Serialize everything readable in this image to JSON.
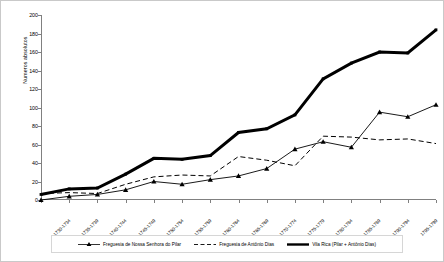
{
  "chart_data": {
    "type": "line",
    "title": "",
    "xlabel": "",
    "ylabel": "Numeros absolutos",
    "ylim": [
      0,
      200
    ],
    "ytick_step": 20,
    "grid": false,
    "legend_position": "bottom",
    "categories": [
      "1730-1734",
      "1735-1739",
      "1740-1744",
      "1745-1749",
      "1750-1754",
      "1755-1759",
      "1760-1764",
      "1765-1769",
      "1770-1774",
      "1775-1779",
      "1780-1784",
      "1785-1789",
      "1790-1794",
      "1795-1799",
      "1800-1804"
    ],
    "yticks": [
      0,
      20,
      40,
      60,
      80,
      100,
      120,
      140,
      160,
      180,
      200
    ],
    "series": [
      {
        "name": "Freguesia de Nossa Senhora do Pilar",
        "style": "solid-thin-triangle-marker",
        "color": "#000000",
        "values": [
          0,
          4,
          6,
          11,
          20,
          17,
          22,
          26,
          34,
          55,
          63,
          57,
          95,
          90,
          103
        ]
      },
      {
        "name": "Freguesia de Antônio Dias",
        "style": "dashed-thin",
        "color": "#000000",
        "values": [
          7,
          8,
          7,
          17,
          25,
          27,
          26,
          47,
          43,
          37,
          69,
          68,
          65,
          66,
          61
        ]
      },
      {
        "name": "Vila Rica (Pilar + Antônio Dias)",
        "style": "solid-thick",
        "color": "#000000",
        "values": [
          6,
          12,
          13,
          28,
          45,
          44,
          48,
          73,
          77,
          92,
          131,
          148,
          160,
          159,
          184
        ]
      }
    ]
  }
}
